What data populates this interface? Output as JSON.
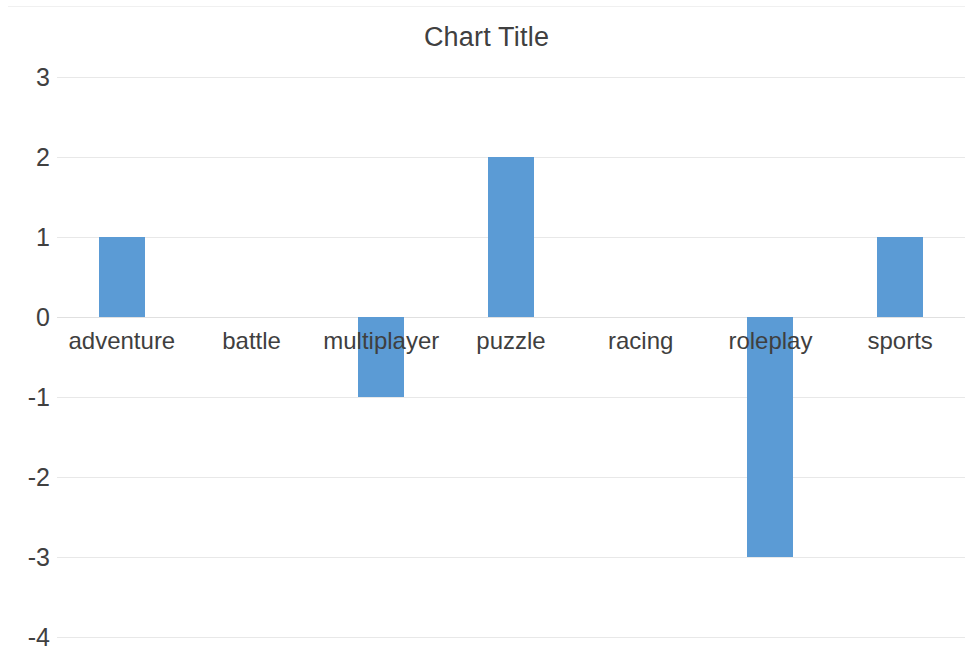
{
  "chart_data": {
    "type": "bar",
    "title": "Chart Title",
    "xlabel": "",
    "ylabel": "",
    "categories": [
      "adventure",
      "battle",
      "multiplayer",
      "puzzle",
      "racing",
      "roleplay",
      "sports"
    ],
    "values": [
      1,
      0,
      -1,
      2,
      0,
      -3,
      1
    ],
    "series": [
      {
        "name": "Series 1",
        "values": [
          1,
          0,
          -1,
          2,
          0,
          -3,
          1
        ]
      }
    ],
    "ylim": [
      -4,
      3
    ],
    "ytick_labels": [
      "3",
      "2",
      "1",
      "0",
      "-1",
      "-2",
      "-3",
      "-4"
    ],
    "ytick_values": [
      3,
      2,
      1,
      0,
      -1,
      -2,
      -3,
      -4
    ],
    "grid": true,
    "legend": false,
    "legend_position": "none",
    "bar_color": "#5B9BD5",
    "gridline_color": "#E8E8E8",
    "text_color": "#404040",
    "background": "#FFFFFF",
    "category_labels_at_zero": true
  }
}
